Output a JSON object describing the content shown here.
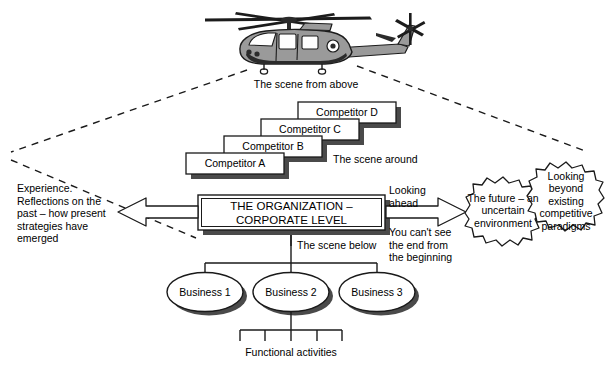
{
  "diagram": {
    "title_alt": "Strategic management helicopter view diagram",
    "vehicle": {
      "icon": "helicopter-icon",
      "caption": "The scene from above"
    },
    "competitors": {
      "around_label": "The scene around",
      "boxes": [
        {
          "label": "Competitor D"
        },
        {
          "label": "Competitor C"
        },
        {
          "label": "Competitor B"
        },
        {
          "label": "Competitor A"
        }
      ]
    },
    "organization": {
      "line1": "THE ORGANIZATION –",
      "line2": "CORPORATE LEVEL"
    },
    "left_note": "Experience.\nReflections on the\npast – how present\nstrategies have\nemerged",
    "right": {
      "arrow_top_label": "Looking\nahead",
      "arrow_bottom_label": "You can't see\nthe end from\nthe beginning",
      "cloud_future": "The future –\nan uncertain\nenvironment",
      "cloud_paradigms": "Looking\nbeyond\nexisting\ncompetitive\nparadigms"
    },
    "below": {
      "label": "The scene below",
      "businesses": [
        {
          "label": "Business 1"
        },
        {
          "label": "Business 2"
        },
        {
          "label": "Business 3"
        }
      ],
      "functional_label": "Functional activities"
    },
    "colors": {
      "ink": "#000000",
      "background": "#ffffff",
      "shadow": "#4a4a4a",
      "body_gray": "#9a9a9a",
      "dark_gray": "#3d3d3d"
    }
  }
}
